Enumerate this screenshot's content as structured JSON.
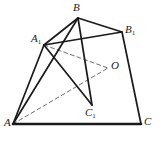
{
  "figure": {
    "type": "line-diagram",
    "width": 160,
    "height": 149,
    "background": "#ffffff",
    "stroke_color": "#1a1a1a",
    "dash_color": "#6e6e6e",
    "solid_width": 1.7,
    "bold_width": 2.6,
    "dash_width": 1.0,
    "dash_pattern": "4,3"
  },
  "points": {
    "A": {
      "label": "A",
      "sub": "",
      "x": 13,
      "y": 124,
      "label_x": 4,
      "label_y": 117
    },
    "B": {
      "label": "B",
      "sub": "",
      "x": 78,
      "y": 18,
      "label_x": 73,
      "label_y": 2
    },
    "C": {
      "label": "C",
      "sub": "",
      "x": 141,
      "y": 124,
      "label_x": 144,
      "label_y": 116
    },
    "A1": {
      "label": "A",
      "sub": "1",
      "x": 44,
      "y": 45,
      "label_x": 31,
      "label_y": 33
    },
    "B1": {
      "label": "B",
      "sub": "1",
      "x": 122,
      "y": 32,
      "label_x": 125,
      "label_y": 24
    },
    "C1": {
      "label": "C",
      "sub": "1",
      "x": 92,
      "y": 105,
      "label_x": 85,
      "label_y": 107
    },
    "O": {
      "label": "O",
      "sub": "",
      "x": 108,
      "y": 68,
      "label_x": 111,
      "label_y": 60
    }
  },
  "edges": {
    "solid": [
      {
        "name": "A-C",
        "from": "A",
        "to": "C",
        "weight": "bold"
      },
      {
        "name": "A-A1",
        "from": "A",
        "to": "A1",
        "weight": "normal"
      },
      {
        "name": "A-B",
        "from": "A",
        "to": "B",
        "weight": "normal"
      },
      {
        "name": "B-A1",
        "from": "B",
        "to": "A1",
        "weight": "normal"
      },
      {
        "name": "B-B1",
        "from": "B",
        "to": "B1",
        "weight": "normal"
      },
      {
        "name": "B-C1",
        "from": "B",
        "to": "C1",
        "weight": "normal"
      },
      {
        "name": "A1-B1",
        "from": "A1",
        "to": "B1",
        "weight": "normal"
      },
      {
        "name": "A1-C1",
        "from": "A1",
        "to": "C1",
        "weight": "normal"
      },
      {
        "name": "B1-C",
        "from": "B1",
        "to": "C",
        "weight": "normal"
      }
    ],
    "dashed": [
      {
        "name": "A1-O",
        "from": "A1",
        "to": "O"
      },
      {
        "name": "A-O",
        "from": "A",
        "to": "O"
      }
    ]
  }
}
